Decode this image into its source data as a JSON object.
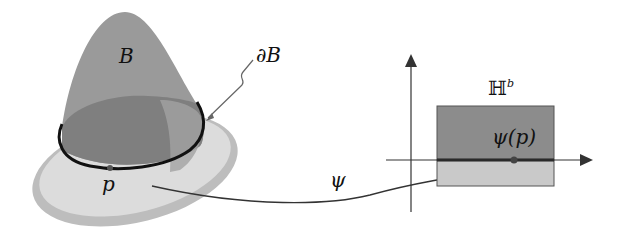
{
  "diagram": {
    "manifold_label": "B",
    "boundary_label": "∂B",
    "point_label": "p",
    "map_label": "ψ",
    "halfspace_label": "ℍ",
    "halfspace_superscript": "b",
    "image_point_label": "ψ(p)"
  },
  "colors": {
    "bump_dark": "#8a8a8a",
    "bump_light": "#a9a9a9",
    "disk_fill": "#d6d6d6",
    "disk_rim": "#bdbdbd",
    "rect_upper": "#8c8c8c",
    "rect_lower": "#c8c8c8",
    "line": "#222222",
    "boundary": "#111111"
  }
}
